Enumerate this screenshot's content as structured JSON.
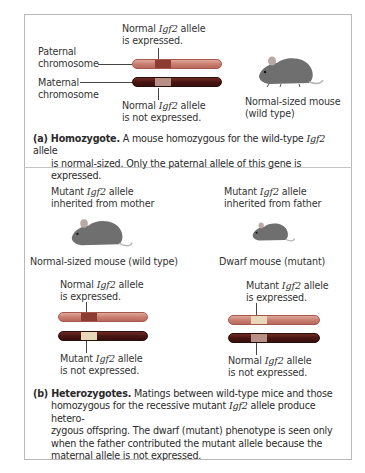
{
  "panel_a": {
    "label_top_line1_pre": "Normal ",
    "label_top_gene": "Igf2",
    "label_top_line1_post": " allele",
    "label_top_line2": "is expressed.",
    "paternal_line1": "Paternal",
    "paternal_line2": "chromosome",
    "maternal_line1": "Maternal",
    "maternal_line2": "chromosome",
    "label_bottom_line1_pre": "Normal ",
    "label_bottom_gene": "Igf2",
    "label_bottom_line1_post": " allele",
    "label_bottom_line2": "is not expressed.",
    "mouse_label_line1": "Normal-sized mouse",
    "mouse_label_line2": "(wild type)",
    "caption_tag": "(a) ",
    "caption_title": "Homozygote.",
    "caption_text1": " A mouse homozygous for the wild-type ",
    "caption_gene": "Igf2",
    "caption_text2": " allele",
    "caption_line2": "is normal-sized. Only the paternal allele of this gene is expressed."
  },
  "panel_b": {
    "left": {
      "header_pre": "Mutant ",
      "header_gene": "Igf2",
      "header_post": " allele",
      "header_line2": "inherited from mother",
      "mouse_label": "Normal-sized mouse (wild type)",
      "top_label_pre": "Normal ",
      "top_label_gene": "Igf2",
      "top_label_post": " allele",
      "top_label_line2": "is expressed.",
      "bottom_label_pre": "Mutant ",
      "bottom_label_gene": "Igf2",
      "bottom_label_post": " allele",
      "bottom_label_line2": "is not expressed."
    },
    "right": {
      "header_pre": "Mutant ",
      "header_gene": "Igf2",
      "header_post": " allele",
      "header_line2": "inherited from father",
      "mouse_label": "Dwarf mouse (mutant)",
      "top_label_pre": "Mutant ",
      "top_label_gene": "Igf2",
      "top_label_post": " allele",
      "top_label_line2": "is expressed.",
      "bottom_label_pre": "Normal ",
      "bottom_label_gene": "Igf2",
      "bottom_label_post": " allele",
      "bottom_label_line2": "is not expressed."
    },
    "caption_tag": "(b) ",
    "caption_title": "Heterozygotes.",
    "caption_line1": " Matings between wild-type mice and those",
    "caption_line2_pre": "homozygous for the recessive mutant ",
    "caption_gene": "Igf2",
    "caption_line2_post": " allele produce hetero-",
    "caption_line3": "zygous offspring. The dwarf (mutant) phenotype is seen only",
    "caption_line4": "when the father contributed the mutant allele because the",
    "caption_line5": "maternal allele is not expressed."
  },
  "colors": {
    "paternal_chromosome": "#c97f72",
    "maternal_chromosome": "#4a1612",
    "normal_gene_band_paternal": "#8d3c33",
    "mutant_gene_band": "#e8d7b8",
    "mouse_fur": "#6f6f6f",
    "border": "#b9b9b9"
  }
}
